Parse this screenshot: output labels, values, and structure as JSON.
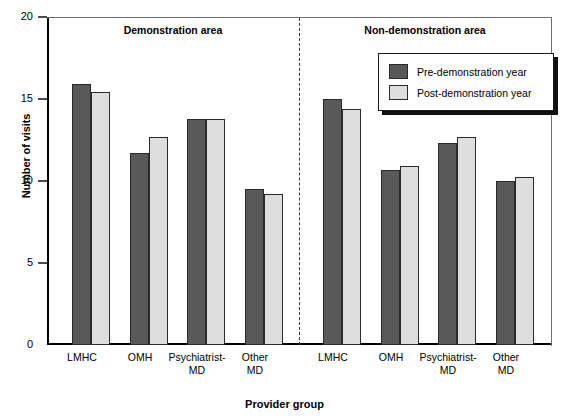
{
  "chart_data": {
    "type": "bar",
    "title": "",
    "xlabel": "Provider group",
    "ylabel": "Number of visits",
    "ylim": [
      0,
      20
    ],
    "yticks": [
      0,
      5,
      10,
      15,
      20
    ],
    "grid": false,
    "legend_position": "top-right",
    "categories": [
      "LMHC",
      "OMH",
      "Psychiatrist-MD",
      "Other MD"
    ],
    "panels": [
      {
        "name": "Demonstration area",
        "series": [
          {
            "name": "Pre-demonstration year",
            "values": [
              15.9,
              11.7,
              13.8,
              9.5
            ]
          },
          {
            "name": "Post-demonstration year",
            "values": [
              15.4,
              12.7,
              13.8,
              9.2
            ]
          }
        ]
      },
      {
        "name": "Non-demonstration area",
        "series": [
          {
            "name": "Pre-demonstration year",
            "values": [
              15.0,
              10.7,
              12.3,
              10.0
            ]
          },
          {
            "name": "Post-demonstration year",
            "values": [
              14.4,
              10.9,
              12.7,
              10.25
            ]
          }
        ]
      }
    ],
    "series_colors": {
      "Pre-demonstration year": "#595959",
      "Post-demonstration year": "#dedede"
    }
  },
  "axes": {
    "y_title": "Number of visits",
    "x_title": "Provider group",
    "y_tick_labels": [
      "20",
      "15",
      "10",
      "5",
      "0"
    ]
  },
  "panel_titles": {
    "left": "Demonstration area",
    "right": "Non-demonstration area"
  },
  "category_labels": {
    "lmhc": "LMHC",
    "omh": "OMH",
    "psychiatrist_line1": "Psychiatrist-",
    "psychiatrist_line2": "MD",
    "other_line1": "Other",
    "other_line2": "MD"
  },
  "legend": {
    "items": [
      {
        "label": "Pre-demonstration year",
        "color": "#595959"
      },
      {
        "label": "Post-demonstration year",
        "color": "#dedede"
      }
    ]
  }
}
